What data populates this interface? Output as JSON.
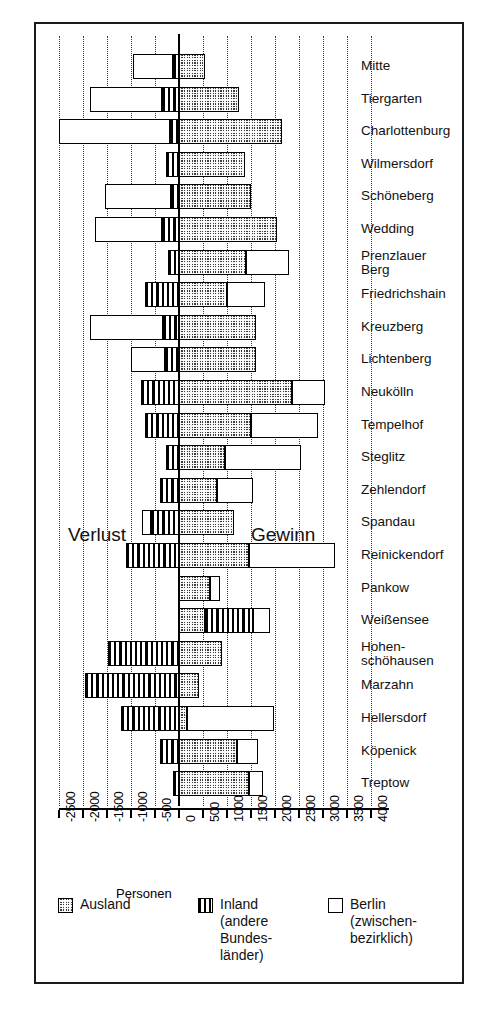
{
  "chart_data": {
    "type": "bar",
    "orientation": "horizontal",
    "stacked": true,
    "title": "",
    "xlabel": "Personen",
    "ylabel": "",
    "xlim": [
      -2500,
      4000
    ],
    "xticks": [
      -2500,
      -2000,
      -1500,
      -1000,
      -500,
      0,
      500,
      1000,
      1500,
      2000,
      2500,
      3000,
      3500,
      4000
    ],
    "xticklabels": [
      "-2500",
      "-2000",
      "-1500",
      "-1000",
      "-500",
      "0",
      "500",
      "1000",
      "1500",
      "2000",
      "2500",
      "3000",
      "3500",
      "4000"
    ],
    "grid": true,
    "grid_style": "dotted vertical",
    "legend_position": "bottom",
    "annotations": [
      {
        "text": "Verlust",
        "side": "left"
      },
      {
        "text": "Gewinn",
        "side": "right"
      }
    ],
    "series": [
      {
        "name": "Ausland",
        "pattern": "checkerboard"
      },
      {
        "name": "Inland (andere Bundesländer)",
        "pattern": "vertical-stripes"
      },
      {
        "name": "Berlin (zwischenbezirklich)",
        "pattern": "white"
      }
    ],
    "categories": [
      "Mitte",
      "Tiergarten",
      "Charlottenburg",
      "Wilmersdorf",
      "Schöneberg",
      "Wedding",
      "Prenzlauer\nBerg",
      "Friedrichshain",
      "Kreuzberg",
      "Lichtenberg",
      "Neukölln",
      "Tempelhof",
      "Steglitz",
      "Zehlendorf",
      "Spandau",
      "Reinickendorf",
      "Pankow",
      "Weißensee",
      "Hohen-\nschöhausen",
      "Marzahn",
      "Hellersdorf",
      "Köpenick",
      "Treptow"
    ],
    "rows": [
      {
        "category": "Mitte",
        "ausland": 550,
        "inland": -120,
        "berlin": -830
      },
      {
        "category": "Tiergarten",
        "ausland": 1250,
        "inland": -350,
        "berlin": -1500
      },
      {
        "category": "Charlottenburg",
        "ausland": 2150,
        "inland": -180,
        "berlin": -2320
      },
      {
        "category": "Wilmersdorf",
        "ausland": 1380,
        "inland": -270,
        "berlin": 0
      },
      {
        "category": "Schöneberg",
        "ausland": 1500,
        "inland": -170,
        "berlin": -1380
      },
      {
        "category": "Wedding",
        "ausland": 2050,
        "inland": -350,
        "berlin": -1400
      },
      {
        "category": "Prenzlauer Berg",
        "ausland": 1400,
        "inland": -230,
        "berlin": 900
      },
      {
        "category": "Friedrichshain",
        "ausland": 1000,
        "inland": -700,
        "berlin": 800
      },
      {
        "category": "Kreuzberg",
        "ausland": 1600,
        "inland": -330,
        "berlin": -1520
      },
      {
        "category": "Lichtenberg",
        "ausland": 1600,
        "inland": -290,
        "berlin": -700
      },
      {
        "category": "Neukölln",
        "ausland": 2350,
        "inland": -800,
        "berlin": 700
      },
      {
        "category": "Tempelhof",
        "ausland": 1500,
        "inland": -700,
        "berlin": 1400
      },
      {
        "category": "Steglitz",
        "ausland": 950,
        "inland": -270,
        "berlin": 1600
      },
      {
        "category": "Zehlendorf",
        "ausland": 800,
        "inland": -400,
        "berlin": 750
      },
      {
        "category": "Spandau",
        "ausland": 1150,
        "inland": -580,
        "berlin": -190
      },
      {
        "category": "Reinickendorf",
        "ausland": 1450,
        "inland": -1100,
        "berlin": 1800
      },
      {
        "category": "Pankow",
        "ausland": 650,
        "inland": 0,
        "berlin": 200
      },
      {
        "category": "Weißensee",
        "ausland": 550,
        "inland": 1000,
        "berlin": 350
      },
      {
        "category": "Hohenschöhausen",
        "ausland": 900,
        "inland": -1480,
        "berlin": 0
      },
      {
        "category": "Marzahn",
        "ausland": 420,
        "inland": -1950,
        "berlin": 0
      },
      {
        "category": "Hellersdorf",
        "ausland": 170,
        "inland": -1200,
        "berlin": 1800
      },
      {
        "category": "Köpenick",
        "ausland": 1200,
        "inland": -400,
        "berlin": 450
      },
      {
        "category": "Treptow",
        "ausland": 1450,
        "inland": -120,
        "berlin": 300
      }
    ]
  },
  "axis": {
    "xlabel": "Personen"
  },
  "annotations": {
    "verlust": "Verlust",
    "gewinn": "Gewinn"
  },
  "legend": {
    "items": [
      {
        "label": "Ausland",
        "pattern": "checkerboard"
      },
      {
        "label": "Inland\n(andere\nBundes-\nländer)",
        "pattern": "vertical-stripes"
      },
      {
        "label": "Berlin\n(zwischen-\nbezirklich)",
        "pattern": "white"
      }
    ]
  },
  "colors": {
    "ink": "#000000",
    "paper": "#ffffff",
    "pattern_fill": "#3d3d3d"
  }
}
